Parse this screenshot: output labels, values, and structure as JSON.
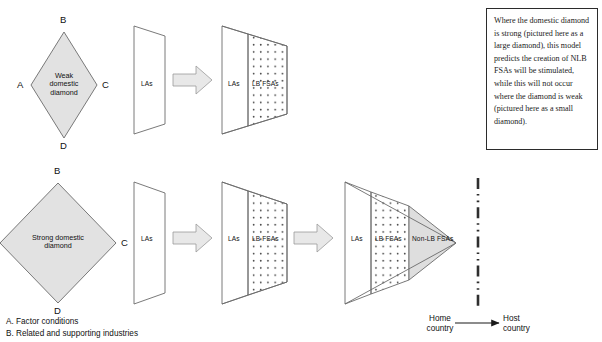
{
  "diagram": {
    "colors": {
      "shape_fill": "#ffffff",
      "diamond_fill": "#e2e2e2",
      "arrow_fill": "#e8e8e8",
      "nonlb_fill": "#dedede",
      "stroke": "#6b6b6b",
      "text": "#111111",
      "note_border": "#2b2b2b"
    },
    "diamonds": [
      {
        "id": "weak-diamond",
        "label": "Weak\ndomestic\ndiamond",
        "label_lines": [
          "Weak",
          "domestic",
          "diamond"
        ],
        "vertices": {
          "top": "B",
          "left": "A",
          "right": "C",
          "bottom": "D"
        }
      },
      {
        "id": "strong-diamond",
        "label": "Strong domestic diamond",
        "label_lines": [
          "Strong domestic",
          "diamond"
        ],
        "vertices": {
          "top": "B",
          "left": "A",
          "right": "C",
          "bottom": "D"
        }
      }
    ],
    "row_top": {
      "stage1": {
        "segments": [
          "LAs"
        ]
      },
      "stage2": {
        "segments": [
          "LAs",
          "LB FSAs"
        ]
      }
    },
    "row_bottom": {
      "stage1": {
        "segments": [
          "LAs"
        ]
      },
      "stage2": {
        "segments": [
          "LAs",
          "LB FSAs"
        ]
      },
      "stage3": {
        "segments": [
          "LAs",
          "LB FSAs",
          "Non-LB FSAs"
        ]
      }
    },
    "segment_labels": {
      "las": "LAs",
      "lb_fsas": "LB FSAs",
      "non_lb_fsas": "Non-LB FSAs"
    },
    "note": {
      "text": "Where the domestic diamond is strong (pictured here as a large diamond), this model predicts the creation of NLB FSAs will be stimulated, while this will not occur where the diamond is weak (pictured here as a small diamond)."
    },
    "country_divider": {
      "home_label_lines": [
        "Home",
        "country"
      ],
      "host_label_lines": [
        "Host",
        "country"
      ],
      "home_label": "Home country",
      "host_label": "Host country"
    },
    "legend": {
      "items": [
        "A. Factor conditions",
        "B. Related and supporting industries"
      ]
    }
  }
}
